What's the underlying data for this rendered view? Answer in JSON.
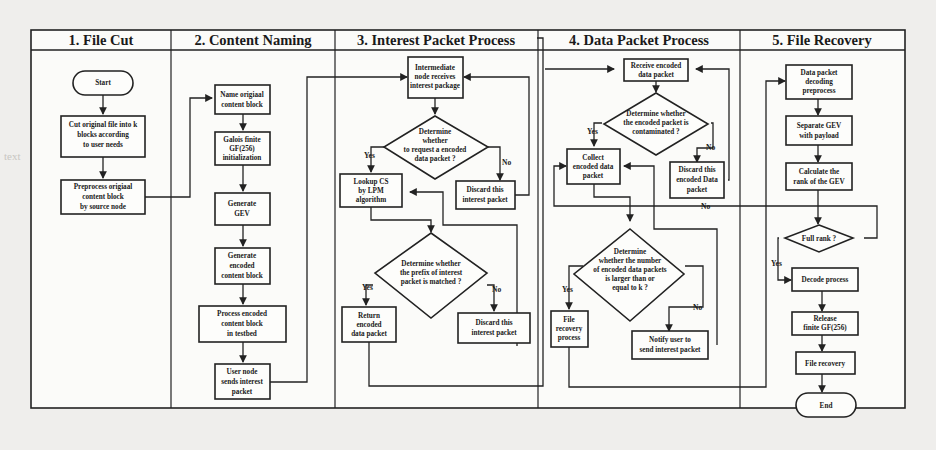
{
  "lanes": [
    {
      "id": "file-cut",
      "title": "1. File Cut"
    },
    {
      "id": "content-naming",
      "title": "2. Content Naming"
    },
    {
      "id": "interest-packet",
      "title": "3. Interest Packet Process"
    },
    {
      "id": "data-packet",
      "title": "4. Data Packet Process"
    },
    {
      "id": "file-recovery",
      "title": "5. File Recovery"
    }
  ],
  "nodes": {
    "start": {
      "lines": [
        "Start"
      ]
    },
    "cut_file": {
      "lines": [
        "Cut original file into k",
        "blocks according",
        "to user needs"
      ]
    },
    "preprocess": {
      "lines": [
        "Preprocess origiaal",
        "content block",
        "by source node"
      ]
    },
    "name_block": {
      "lines": [
        "Name origiaal",
        "content block"
      ]
    },
    "galois": {
      "lines": [
        "Galois finite",
        "GF(256)",
        "initialization"
      ]
    },
    "gen_gev": {
      "lines": [
        "Generate",
        "GEV"
      ]
    },
    "gen_encoded": {
      "lines": [
        "Generate",
        "encoded",
        "content block"
      ]
    },
    "process_encoded": {
      "lines": [
        "Process encoded",
        "content block",
        "in testbed"
      ]
    },
    "user_sends": {
      "lines": [
        "User node",
        "sends interest",
        "packet"
      ]
    },
    "intermediate": {
      "lines": [
        "Intermediate",
        "node receives",
        "interest package"
      ]
    },
    "determine_request": {
      "lines": [
        "Determine",
        "whether",
        "to request a encoded",
        "data packet ?"
      ]
    },
    "lookup_cs": {
      "lines": [
        "Lookup  CS",
        "by LPM",
        "algorithm"
      ]
    },
    "discard_interest_1": {
      "lines": [
        "Discard this",
        "interest packet"
      ]
    },
    "determine_prefix": {
      "lines": [
        "Determine whether",
        "the prefix of  interest",
        "packet  is matched ?"
      ]
    },
    "return_encoded": {
      "lines": [
        "Return",
        "encoded",
        "data packet"
      ]
    },
    "discard_interest_2": {
      "lines": [
        "Discard this",
        "interest packet"
      ]
    },
    "receive_encoded": {
      "lines": [
        "Receive encoded",
        "data packet"
      ]
    },
    "determine_contaminated": {
      "lines": [
        "Determine whether",
        "the encoded packet is",
        "contaminated ?"
      ]
    },
    "collect_encoded": {
      "lines": [
        "Collect",
        "encoded data",
        "packet"
      ]
    },
    "discard_data": {
      "lines": [
        "Discard this",
        "encoded Data",
        "packet"
      ]
    },
    "determine_number": {
      "lines": [
        "Determine",
        "whether the number",
        "of encoded data packets",
        "is larger than or",
        "equal to  k ?"
      ]
    },
    "file_recovery_process": {
      "lines": [
        "File",
        "recovery",
        "process"
      ]
    },
    "notify_user": {
      "lines": [
        "Notify user to",
        "send interest packet"
      ]
    },
    "decoding_preprocess": {
      "lines": [
        "Data packet",
        "decoding",
        "preprocess"
      ]
    },
    "separate_gev": {
      "lines": [
        "Separate GEV",
        "with payload"
      ]
    },
    "calc_rank": {
      "lines": [
        "Calculate the",
        "rank of the GEV"
      ]
    },
    "full_rank": {
      "lines": [
        "Full rank ?"
      ]
    },
    "decode_process": {
      "lines": [
        "Decode process"
      ]
    },
    "release_gf": {
      "lines": [
        "Release",
        "finite GF(256)"
      ]
    },
    "file_recovery": {
      "lines": [
        "File recovery"
      ]
    },
    "end": {
      "lines": [
        "End"
      ]
    }
  },
  "edge_labels": {
    "yes": "Yes",
    "no": "No"
  }
}
